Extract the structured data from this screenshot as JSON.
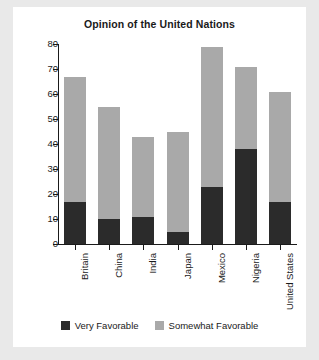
{
  "chart_data": {
    "type": "bar",
    "title": "Opinion of the United Nations",
    "xlabel": "",
    "ylabel": "",
    "ylim": [
      0,
      80
    ],
    "yticks": [
      0,
      10,
      20,
      30,
      40,
      50,
      60,
      70,
      80
    ],
    "grid": false,
    "stacked": true,
    "legend_position": "bottom",
    "categories": [
      "Britain",
      "China",
      "India",
      "Japan",
      "Mexico",
      "Nigeria",
      "United States"
    ],
    "series": [
      {
        "name": "Very Favorable",
        "color": "#2b2b2b",
        "values": [
          17,
          10,
          11,
          5,
          23,
          38,
          17
        ]
      },
      {
        "name": "Somewhat Favorable",
        "color": "#a9a9a9",
        "values": [
          50,
          45,
          32,
          40,
          56,
          33,
          44
        ]
      }
    ],
    "totals": [
      67,
      55,
      43,
      45,
      79,
      71,
      61
    ]
  },
  "legend": {
    "items": [
      {
        "label": "Very Favorable",
        "color": "#2b2b2b"
      },
      {
        "label": "Somewhat Favorable",
        "color": "#a9a9a9"
      }
    ]
  }
}
